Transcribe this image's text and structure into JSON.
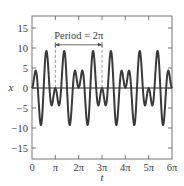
{
  "chart_data": {
    "type": "line",
    "title": "",
    "xlabel": "t",
    "ylabel": "x",
    "xlim_pi_units": [
      0,
      6
    ],
    "ylim": [
      -17.75,
      18
    ],
    "grid": false,
    "legend": null,
    "function_description": "x = 10 sin(t) sin(4t) = 5[cos(3t) - cos(5t)]",
    "x_ticks": [
      {
        "value_pi": 0,
        "label": "0"
      },
      {
        "value_pi": 1,
        "label": "π"
      },
      {
        "value_pi": 2,
        "label": "2π"
      },
      {
        "value_pi": 3,
        "label": "3π"
      },
      {
        "value_pi": 4,
        "label": "4π"
      },
      {
        "value_pi": 5,
        "label": "5π"
      },
      {
        "value_pi": 6,
        "label": "6π"
      }
    ],
    "y_ticks": [
      {
        "value": 15,
        "label": "15"
      },
      {
        "value": 10,
        "label": "10"
      },
      {
        "value": 5,
        "label": "5"
      },
      {
        "value": 0,
        "label": "0"
      },
      {
        "value": -5,
        "label": "−5"
      },
      {
        "value": -10,
        "label": "−10"
      },
      {
        "value": -15,
        "label": "−15"
      }
    ],
    "series": [
      {
        "name": "x(t)",
        "color": "#3a3a3a",
        "sample_step_pi": 0.041666667,
        "one_period_values": [
          0,
          0.65,
          2.24,
          3.83,
          4.33,
          3.04,
          0,
          -3.97,
          -7.5,
          -9.24,
          -8.37,
          -4.96,
          0,
          4.96,
          8.37,
          9.24,
          7.5,
          3.97,
          0,
          -3.04,
          -4.33,
          -3.83,
          -2.24,
          -0.65,
          0,
          -0.65,
          -2.24,
          -3.83,
          -4.33,
          -3.04,
          0,
          3.97,
          7.5,
          9.24,
          8.37,
          4.96,
          0,
          -4.96,
          -8.37,
          -9.24,
          -7.5,
          -3.97,
          0,
          3.04,
          4.33,
          3.83,
          2.24,
          0.65,
          0
        ],
        "periods_shown": 3
      }
    ],
    "annotations": [
      {
        "text": "Period = 2π",
        "arrow_from_pi": 1,
        "arrow_to_pi": 3,
        "y": 10.8,
        "dashed_guides_at_pi": [
          1,
          3
        ]
      }
    ]
  },
  "colors": {
    "curve": "#3a3a3a",
    "axes": "#555555",
    "dashed": "#888888"
  }
}
